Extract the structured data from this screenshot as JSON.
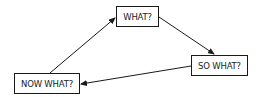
{
  "diagram": {
    "type": "cycle-flow",
    "nodes": [
      {
        "id": "what",
        "label": "WHAT?"
      },
      {
        "id": "so_what",
        "label": "SO WHAT?"
      },
      {
        "id": "now_what",
        "label": "NOW WHAT?"
      }
    ],
    "edges": [
      {
        "from": "now_what",
        "to": "what"
      },
      {
        "from": "what",
        "to": "so_what"
      },
      {
        "from": "so_what",
        "to": "now_what"
      }
    ]
  },
  "colors": {
    "stroke": "#1a1a1a",
    "text": "#222222",
    "background": "#ffffff"
  }
}
